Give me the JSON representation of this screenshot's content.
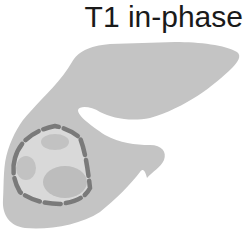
{
  "diagram": {
    "title": "T1 in-phase",
    "colors": {
      "background": "#ffffff",
      "liver_parenchyma": "#c4c4c4",
      "lesion_interior": "#d9d9d9",
      "lesion_nodules": "#bdbdbd",
      "lesion_border_dashed": "#7a7a7a",
      "title_text": "#1a1a1a"
    },
    "elements": [
      {
        "id": "liver",
        "type": "organ-outline",
        "label": "liver"
      },
      {
        "id": "lesion",
        "type": "dashed-outline-lesion",
        "label": "lesion"
      },
      {
        "id": "nodule-top",
        "type": "inner-nodule"
      },
      {
        "id": "nodule-left",
        "type": "inner-nodule"
      },
      {
        "id": "nodule-bottom",
        "type": "inner-nodule"
      }
    ]
  }
}
